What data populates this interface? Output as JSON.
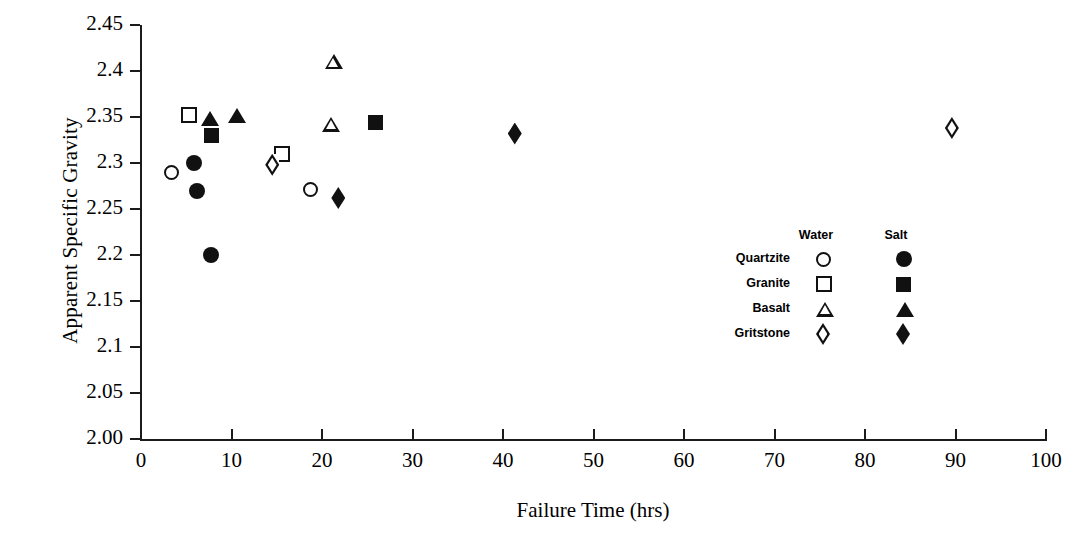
{
  "chart_data": {
    "type": "scatter",
    "title": "",
    "xlabel": "Failure Time (hrs)",
    "ylabel": "Apparent Specific Gravity",
    "xlim": [
      0,
      100
    ],
    "ylim": [
      2.0,
      2.45
    ],
    "xticks": [
      "0",
      "10",
      "20",
      "30",
      "40",
      "50",
      "60",
      "70",
      "80",
      "90",
      "100"
    ],
    "yticks": [
      "2.00",
      "2.05",
      "2.1",
      "2.15",
      "2.2",
      "2.25",
      "2.3",
      "2.35",
      "2.4",
      "2.45"
    ],
    "grid": false,
    "legend_position": "inside-right",
    "legend": {
      "columns": [
        "Water",
        "Salt"
      ],
      "rows": [
        {
          "label": "Quartzite",
          "water_marker": "circle-open",
          "salt_marker": "circle-fill"
        },
        {
          "label": "Granite",
          "water_marker": "square-open",
          "salt_marker": "square-fill"
        },
        {
          "label": "Basalt",
          "water_marker": "triangle-open",
          "salt_marker": "triangle-fill"
        },
        {
          "label": "Gritstone",
          "water_marker": "diamond-open",
          "salt_marker": "diamond-fill"
        }
      ]
    },
    "series": [
      {
        "name": "Quartzite - Water",
        "marker": "circle-open",
        "points": [
          {
            "x": 3.4,
            "y": 2.29
          },
          {
            "x": 18.7,
            "y": 2.271
          }
        ]
      },
      {
        "name": "Quartzite - Salt",
        "marker": "circle-fill",
        "points": [
          {
            "x": 5.9,
            "y": 2.3
          },
          {
            "x": 6.2,
            "y": 2.27
          },
          {
            "x": 7.7,
            "y": 2.2
          }
        ]
      },
      {
        "name": "Granite - Water",
        "marker": "square-open",
        "points": [
          {
            "x": 5.3,
            "y": 2.352
          },
          {
            "x": 15.6,
            "y": 2.31
          }
        ]
      },
      {
        "name": "Granite - Salt",
        "marker": "square-fill",
        "points": [
          {
            "x": 7.8,
            "y": 2.33
          },
          {
            "x": 25.9,
            "y": 2.344
          }
        ]
      },
      {
        "name": "Basalt - Water",
        "marker": "triangle-open",
        "points": [
          {
            "x": 21.3,
            "y": 2.41
          },
          {
            "x": 21.0,
            "y": 2.342
          }
        ]
      },
      {
        "name": "Basalt - Salt",
        "marker": "triangle-fill",
        "points": [
          {
            "x": 7.6,
            "y": 2.348
          },
          {
            "x": 10.6,
            "y": 2.352
          }
        ]
      },
      {
        "name": "Gritstone - Water",
        "marker": "diamond-open",
        "points": [
          {
            "x": 14.5,
            "y": 2.298
          },
          {
            "x": 89.6,
            "y": 2.338
          }
        ]
      },
      {
        "name": "Gritstone - Salt",
        "marker": "diamond-fill",
        "points": [
          {
            "x": 21.8,
            "y": 2.262
          },
          {
            "x": 41.3,
            "y": 2.332
          }
        ]
      }
    ]
  }
}
